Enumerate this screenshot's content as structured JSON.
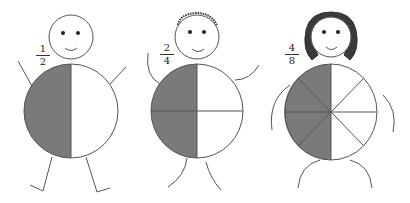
{
  "figures": [
    {
      "name": "figure-halves",
      "fraction": {
        "numerator": "1",
        "denominator": "2"
      },
      "parts": 2,
      "shaded": 1,
      "hair": "none"
    },
    {
      "name": "figure-quarters",
      "fraction": {
        "numerator": "2",
        "denominator": "4"
      },
      "parts": 4,
      "shaded": 2,
      "hair": "short"
    },
    {
      "name": "figure-eighths",
      "fraction": {
        "numerator": "4",
        "denominator": "8"
      },
      "parts": 8,
      "shaded": 4,
      "hair": "long"
    }
  ],
  "colors": {
    "shade": "#7a7a7a",
    "line": "#555555",
    "face": "#222222"
  }
}
